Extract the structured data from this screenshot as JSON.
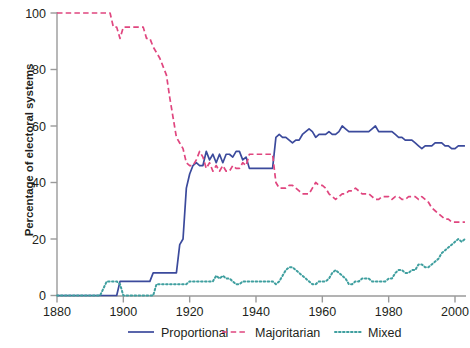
{
  "chart_data": {
    "type": "line",
    "title": "",
    "xlabel": "",
    "ylabel": "Percentage of electoral systems",
    "xlim": [
      1880,
      2004
    ],
    "ylim": [
      0,
      100
    ],
    "xticks": [
      1880,
      1900,
      1920,
      1940,
      1960,
      1980,
      2000
    ],
    "yticks": [
      0,
      20,
      40,
      60,
      80,
      100
    ],
    "grid": false,
    "legend_position": "bottom",
    "colors": {
      "proportional": "#3b4a9c",
      "majoritarian": "#e0467f",
      "mixed": "#3f9f9f",
      "axis": "#9a9a9a",
      "text": "#231f20"
    },
    "series": [
      {
        "name": "Proportional",
        "style": "solid",
        "color": "#3b4a9c",
        "x": [
          1880,
          1885,
          1890,
          1893,
          1895,
          1896,
          1897,
          1898,
          1899,
          1900,
          1901,
          1902,
          1903,
          1904,
          1905,
          1906,
          1907,
          1908,
          1909,
          1910,
          1911,
          1912,
          1913,
          1914,
          1915,
          1916,
          1917,
          1918,
          1919,
          1920,
          1921,
          1922,
          1923,
          1924,
          1925,
          1926,
          1927,
          1928,
          1929,
          1930,
          1931,
          1932,
          1933,
          1934,
          1935,
          1936,
          1937,
          1938,
          1939,
          1940,
          1941,
          1942,
          1943,
          1944,
          1945,
          1946,
          1947,
          1948,
          1949,
          1950,
          1951,
          1952,
          1953,
          1954,
          1955,
          1956,
          1957,
          1958,
          1959,
          1960,
          1961,
          1962,
          1963,
          1964,
          1965,
          1966,
          1967,
          1968,
          1969,
          1970,
          1971,
          1972,
          1973,
          1974,
          1975,
          1976,
          1977,
          1978,
          1979,
          1980,
          1981,
          1982,
          1983,
          1984,
          1985,
          1986,
          1987,
          1988,
          1989,
          1990,
          1991,
          1992,
          1993,
          1994,
          1995,
          1996,
          1997,
          1998,
          1999,
          2000,
          2001,
          2002,
          2003
        ],
        "y": [
          0,
          0,
          0,
          0,
          0,
          0,
          0,
          0,
          5,
          5,
          5,
          5,
          5,
          5,
          5,
          5,
          5,
          5,
          8,
          8,
          8,
          8,
          8,
          8,
          8,
          8,
          18,
          20,
          38,
          43,
          46,
          47,
          46,
          46,
          51,
          48,
          50,
          47,
          50,
          47,
          50,
          50,
          49,
          51,
          51,
          48,
          49,
          45,
          45,
          45,
          45,
          45,
          45,
          45,
          45,
          56,
          57,
          56,
          56,
          55,
          54,
          55,
          55,
          57,
          58,
          59,
          58,
          56,
          57,
          57,
          57,
          58,
          57,
          57,
          58,
          60,
          59,
          58,
          58,
          58,
          58,
          58,
          58,
          58,
          59,
          60,
          58,
          58,
          58,
          58,
          58,
          57,
          56,
          56,
          55,
          55,
          55,
          54,
          53,
          52,
          53,
          53,
          53,
          54,
          54,
          54,
          53,
          53,
          52,
          52,
          53,
          53,
          53
        ]
      },
      {
        "name": "Majoritarian",
        "style": "dashed",
        "color": "#e0467f",
        "x": [
          1880,
          1885,
          1890,
          1893,
          1895,
          1896,
          1897,
          1898,
          1899,
          1900,
          1901,
          1902,
          1903,
          1904,
          1905,
          1906,
          1907,
          1908,
          1909,
          1910,
          1911,
          1912,
          1913,
          1914,
          1915,
          1916,
          1917,
          1918,
          1919,
          1920,
          1921,
          1922,
          1923,
          1924,
          1925,
          1926,
          1927,
          1928,
          1929,
          1930,
          1931,
          1932,
          1933,
          1934,
          1935,
          1936,
          1937,
          1938,
          1939,
          1940,
          1941,
          1942,
          1943,
          1944,
          1945,
          1946,
          1947,
          1948,
          1949,
          1950,
          1951,
          1952,
          1953,
          1954,
          1955,
          1956,
          1957,
          1958,
          1959,
          1960,
          1961,
          1962,
          1963,
          1964,
          1965,
          1966,
          1967,
          1968,
          1969,
          1970,
          1971,
          1972,
          1973,
          1974,
          1975,
          1976,
          1977,
          1978,
          1979,
          1980,
          1981,
          1982,
          1983,
          1984,
          1985,
          1986,
          1987,
          1988,
          1989,
          1990,
          1991,
          1992,
          1993,
          1994,
          1995,
          1996,
          1997,
          1998,
          1999,
          2000,
          2001,
          2002,
          2003
        ],
        "y": [
          100,
          100,
          100,
          100,
          100,
          100,
          95,
          95,
          91,
          95,
          95,
          95,
          95,
          95,
          95,
          95,
          91,
          91,
          88,
          86,
          84,
          81,
          78,
          70,
          63,
          56,
          54,
          52,
          47,
          46,
          46,
          48,
          51,
          49,
          45,
          47,
          44,
          46,
          44,
          46,
          44,
          44,
          46,
          45,
          45,
          47,
          46,
          50,
          50,
          50,
          50,
          50,
          50,
          50,
          50,
          40,
          38,
          38,
          38,
          39,
          39,
          38,
          37,
          36,
          36,
          36,
          38,
          40,
          39,
          39,
          38,
          36,
          35,
          34,
          35,
          36,
          36,
          37,
          37,
          38,
          37,
          36,
          36,
          36,
          35,
          34,
          34,
          35,
          35,
          35,
          34,
          35,
          35,
          34,
          34,
          35,
          35,
          35,
          34,
          35,
          34,
          33,
          31,
          30,
          29,
          28,
          27,
          27,
          26,
          26,
          26,
          26,
          26
        ]
      },
      {
        "name": "Mixed",
        "style": "dotted",
        "color": "#3f9f9f",
        "x": [
          1880,
          1885,
          1890,
          1893,
          1895,
          1896,
          1897,
          1898,
          1899,
          1900,
          1901,
          1902,
          1903,
          1904,
          1905,
          1906,
          1907,
          1908,
          1909,
          1910,
          1911,
          1912,
          1913,
          1914,
          1915,
          1916,
          1917,
          1918,
          1919,
          1920,
          1921,
          1922,
          1923,
          1924,
          1925,
          1926,
          1927,
          1928,
          1929,
          1930,
          1931,
          1932,
          1933,
          1934,
          1935,
          1936,
          1937,
          1938,
          1939,
          1940,
          1941,
          1942,
          1943,
          1944,
          1945,
          1946,
          1947,
          1948,
          1949,
          1950,
          1951,
          1952,
          1953,
          1954,
          1955,
          1956,
          1957,
          1958,
          1959,
          1960,
          1961,
          1962,
          1963,
          1964,
          1965,
          1966,
          1967,
          1968,
          1969,
          1970,
          1971,
          1972,
          1973,
          1974,
          1975,
          1976,
          1977,
          1978,
          1979,
          1980,
          1981,
          1982,
          1983,
          1984,
          1985,
          1986,
          1987,
          1988,
          1989,
          1990,
          1991,
          1992,
          1993,
          1994,
          1995,
          1996,
          1997,
          1998,
          1999,
          2000,
          2001,
          2002,
          2003
        ],
        "y": [
          0,
          0,
          0,
          0,
          5,
          5,
          5,
          5,
          4,
          0,
          0,
          0,
          0,
          0,
          0,
          0,
          0,
          0,
          0,
          4,
          4,
          4,
          4,
          4,
          4,
          4,
          4,
          4,
          4,
          5,
          5,
          5,
          5,
          5,
          5,
          5,
          5,
          7,
          6,
          7,
          6,
          6,
          5,
          4,
          4,
          5,
          5,
          5,
          5,
          5,
          5,
          5,
          5,
          5,
          5,
          4,
          5,
          7,
          9,
          10,
          10,
          9,
          8,
          7,
          6,
          5,
          4,
          4,
          5,
          5,
          5,
          6,
          8,
          9,
          8,
          7,
          6,
          4,
          4,
          5,
          5,
          6,
          6,
          6,
          5,
          5,
          5,
          5,
          5,
          6,
          6,
          8,
          9,
          9,
          8,
          8,
          9,
          9,
          11,
          11,
          10,
          10,
          11,
          12,
          13,
          15,
          16,
          17,
          18,
          19,
          20,
          19,
          20
        ]
      }
    ]
  },
  "axis": {
    "yticklabels": [
      "0",
      "20",
      "40",
      "60",
      "80",
      "100"
    ],
    "xticklabels": [
      "1880",
      "1900",
      "1920",
      "1940",
      "1960",
      "1980",
      "2000"
    ],
    "ylabel": "Percentage of electoral systems"
  },
  "legend": {
    "items": [
      {
        "label": "Proportional",
        "color": "#3b4a9c",
        "style": "solid"
      },
      {
        "label": "Majoritarian",
        "color": "#e0467f",
        "style": "dashed"
      },
      {
        "label": "Mixed",
        "color": "#3f9f9f",
        "style": "dotted"
      }
    ]
  }
}
